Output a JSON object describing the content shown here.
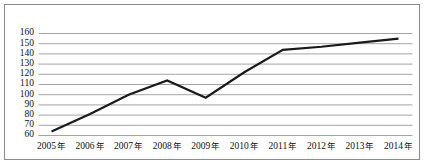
{
  "chart_data": {
    "type": "line",
    "title": "",
    "subtitle": "",
    "xlabel": "",
    "ylabel": "",
    "categories": [
      "2005 年",
      "2006 年",
      "2007 年",
      "2008 年",
      "2009 年",
      "2010 年",
      "2011 年",
      "2012 年",
      "2013 年",
      "2014 年"
    ],
    "x_values": [
      2005,
      2006,
      2007,
      2008,
      2009,
      2010,
      2011,
      2012,
      2013,
      2014
    ],
    "values": [
      64,
      81,
      100,
      114,
      97,
      122,
      144,
      147,
      151,
      155
    ],
    "series": [
      {
        "name": "",
        "values": [
          64,
          81,
          100,
          114,
          97,
          122,
          144,
          147,
          151,
          155
        ],
        "color": "#1a1a1a",
        "line_width": 2.2,
        "markers": false
      }
    ],
    "ylim": [
      60,
      160
    ],
    "yticks": [
      60,
      70,
      80,
      90,
      100,
      110,
      120,
      130,
      140,
      150,
      160
    ],
    "ytick_labels": [
      "60",
      "70",
      "80",
      "90",
      "100",
      "110",
      "120",
      "130",
      "140",
      "150",
      "160"
    ],
    "xtick_labels": [
      "2005 年",
      "2006 年",
      "2007 年",
      "2008 年",
      "2009 年",
      "2010 年",
      "2011 年",
      "2012 年",
      "2013 年",
      "2014 年"
    ],
    "grid": true,
    "grid_axis": "y",
    "grid_color": "#9a9a9a",
    "legend": false,
    "legend_position": "none",
    "annotations": [],
    "frame_border_color": "#8a8a8a",
    "background_color": "#ffffff"
  },
  "figure": {
    "border_color": "#8a8a8a",
    "background": "#ffffff"
  }
}
